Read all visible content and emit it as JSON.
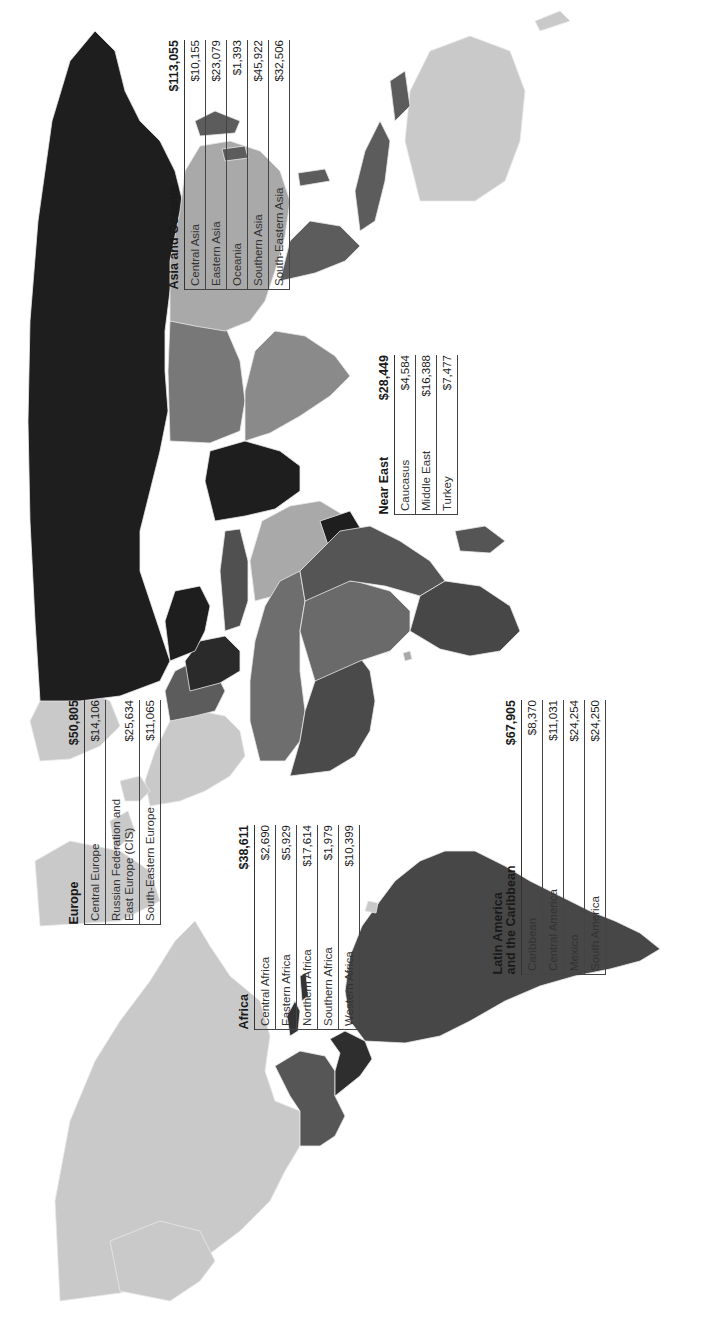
{
  "map": {
    "orientation": "rotated 90 degrees counter-clockwise (north points left)",
    "shading_levels": {
      "darkest": "#1e1e1e",
      "dark": "#474747",
      "medium_dark": "#5c5c5c",
      "medium": "#787878",
      "light": "#a9a9a9",
      "pale": "#c9c9c9"
    }
  },
  "regions": {
    "asia_oceania": {
      "title": "Asia and Oceania",
      "total": "$113,055",
      "rows": [
        {
          "label": "Central Asia",
          "value": "$10,155"
        },
        {
          "label": "Eastern Asia",
          "value": "$23,079"
        },
        {
          "label": "Oceania",
          "value": "$1,393"
        },
        {
          "label": "Southern Asia",
          "value": "$45,922"
        },
        {
          "label": "South-Eastern Asia",
          "value": "$32,506"
        }
      ]
    },
    "near_east": {
      "title": "Near East",
      "total": "$28,449",
      "rows": [
        {
          "label": "Caucasus",
          "value": "$4,584"
        },
        {
          "label": "Middle East",
          "value": "$16,388"
        },
        {
          "label": "Turkey",
          "value": "$7,477"
        }
      ]
    },
    "europe": {
      "title": "Europe",
      "total": "$50,805",
      "rows": [
        {
          "label": "Central Europe",
          "value": "$14,106"
        },
        {
          "label": "Russian Federation and East Europe (CIS)",
          "value": "$25,634"
        },
        {
          "label": "South-Eastern Europe",
          "value": "$11,065"
        }
      ]
    },
    "africa": {
      "title": "Africa",
      "total": "$38,611",
      "rows": [
        {
          "label": "Central Africa",
          "value": "$2,690"
        },
        {
          "label": "Eastern Africa",
          "value": "$5,929"
        },
        {
          "label": "Northern Africa",
          "value": "$17,614"
        },
        {
          "label": "Southern Africa",
          "value": "$1,979"
        },
        {
          "label": "Western Africa",
          "value": "$10,399"
        }
      ]
    },
    "latin_america": {
      "title": "Latin America and the Caribbean",
      "title_line1": "Latin America",
      "title_line2": "and the Caribbean",
      "total": "$67,905",
      "rows": [
        {
          "label": "Caribbean",
          "value": "$8,370"
        },
        {
          "label": "Central America",
          "value": "$11,031"
        },
        {
          "label": "Mexico",
          "value": "$24,254"
        },
        {
          "label": "South America",
          "value": "$24,250"
        }
      ]
    }
  }
}
